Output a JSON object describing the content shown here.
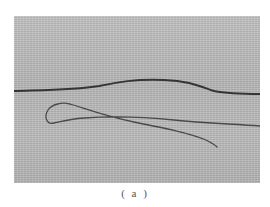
{
  "figure": {
    "background_color": "#b9b9b9",
    "fiber_color": "#3a3a3a"
  },
  "caption": {
    "label": "( a )"
  }
}
